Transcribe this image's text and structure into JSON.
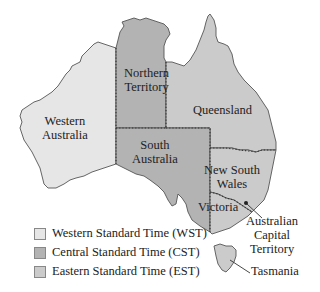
{
  "map": {
    "title": "Australian Time Zones",
    "colors": {
      "wst": "#e6e6e6",
      "cst": "#b3b3b3",
      "est": "#cbcbcb",
      "outline": "#555555"
    },
    "regions": [
      {
        "name": "Western Australia",
        "line1": "Western",
        "line2": "Australia",
        "zone": "WST"
      },
      {
        "name": "Northern Territory",
        "line1": "Northern",
        "line2": "Territory",
        "zone": "CST"
      },
      {
        "name": "South Australia",
        "line1": "South",
        "line2": "Australia",
        "zone": "CST"
      },
      {
        "name": "Queensland",
        "line1": "Queensland",
        "zone": "EST"
      },
      {
        "name": "New South Wales",
        "line1": "New South",
        "line2": "Wales",
        "zone": "EST"
      },
      {
        "name": "Victoria",
        "line1": "Victoria",
        "zone": "EST"
      },
      {
        "name": "Australian Capital Territory",
        "line1": "Australian",
        "line2": "Capital",
        "line3": "Territory",
        "zone": "EST"
      },
      {
        "name": "Tasmania",
        "line1": "Tasmania",
        "zone": "EST"
      }
    ]
  },
  "legend": {
    "items": [
      {
        "label": "Western Standard Time (WST)",
        "color": "#e6e6e6"
      },
      {
        "label": "Central Standard Time (CST)",
        "color": "#b3b3b3"
      },
      {
        "label": "Eastern Standard Time (EST)",
        "color": "#cbcbcb"
      }
    ]
  }
}
